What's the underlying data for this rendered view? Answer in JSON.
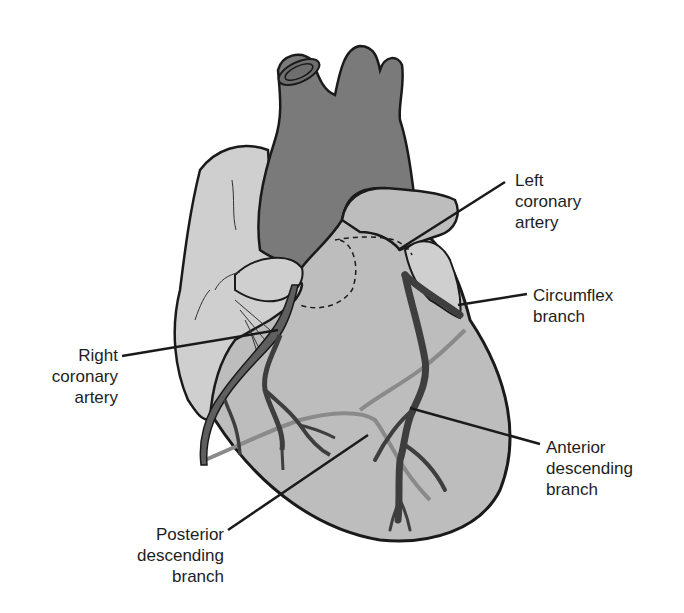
{
  "diagram": {
    "colors": {
      "background": "#ffffff",
      "heart_fill": "#bdbdbd",
      "atrium_fill": "#cfcfcf",
      "great_vessels_fill": "#7a7a7a",
      "artery_fill": "#5f5f5f",
      "outline": "#1a1a1a",
      "posterior_vessel": "#9a9a9a"
    },
    "labels": {
      "left_coronary_artery": "Left\ncoronary\nartery",
      "circumflex_branch": "Circumflex\nbranch",
      "right_coronary_artery": "Right\ncoronary\nartery",
      "anterior_descending_branch": "Anterior\ndescending\nbranch",
      "posterior_descending_branch": "Posterior\ndescending\nbranch"
    }
  }
}
